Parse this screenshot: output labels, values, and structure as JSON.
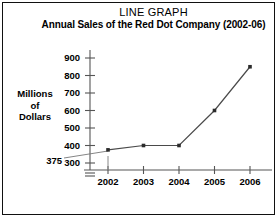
{
  "chart_data": {
    "type": "line",
    "title": "LINE GRAPH",
    "subtitle": "Annual Sales of the Red Dot Company (2002-06)",
    "xlabel": "",
    "ylabel": "Millions of Dollars",
    "categories": [
      "2002",
      "2003",
      "2004",
      "2005",
      "2006"
    ],
    "values": [
      375,
      400,
      400,
      600,
      850
    ],
    "yticks": [
      300,
      400,
      500,
      600,
      700,
      800,
      900
    ],
    "ylim": [
      300,
      900
    ],
    "axis_break": true,
    "grid": false,
    "legend": null,
    "annotations": [
      {
        "label": "375",
        "value": 375,
        "category": "2002",
        "type": "leader-line-callout"
      },
      {
        "label": "",
        "category": "2002",
        "type": "dropline"
      }
    ],
    "marker": "square",
    "line_color": "#4a4a4a",
    "marker_color": "#2b2b2b",
    "axis_color": "#555555",
    "frame_color": "#111111",
    "background": "#ffffff"
  },
  "ylabel_lines": {
    "l1": "Millions",
    "l2": "of",
    "l3": "Dollars"
  }
}
